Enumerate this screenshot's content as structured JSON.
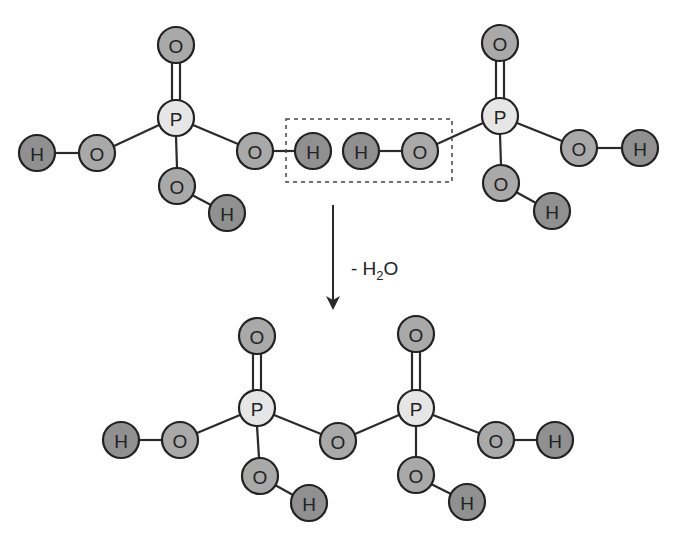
{
  "colors": {
    "phosphorus_fill": "#e6e6e6",
    "oxygen_fill": "#a9a9a9",
    "hydrogen_fill": "#909090",
    "stroke": "#222222"
  },
  "reaction": {
    "label_prefix": "- H",
    "label_sub": "2",
    "label_suffix": "O"
  },
  "atoms": {
    "P": "P",
    "O": "O",
    "H": "H"
  },
  "top_left_molecule": {
    "name": "phosphoric-acid-1",
    "atoms": [
      {
        "id": "tl-P",
        "el": "P",
        "x": 176,
        "y": 118
      },
      {
        "id": "tl-O-top",
        "el": "O",
        "x": 176,
        "y": 45
      },
      {
        "id": "tl-O-left",
        "el": "O",
        "x": 97,
        "y": 153
      },
      {
        "id": "tl-H-left",
        "el": "H",
        "x": 37,
        "y": 153
      },
      {
        "id": "tl-O-right",
        "el": "O",
        "x": 255,
        "y": 151
      },
      {
        "id": "tl-H-right",
        "el": "H",
        "x": 313,
        "y": 151
      },
      {
        "id": "tl-O-bottom",
        "el": "O",
        "x": 177,
        "y": 186
      },
      {
        "id": "tl-H-bottom",
        "el": "H",
        "x": 227,
        "y": 213
      }
    ]
  },
  "top_right_molecule": {
    "name": "phosphoric-acid-2",
    "atoms": [
      {
        "id": "tr-P",
        "el": "P",
        "x": 500,
        "y": 116
      },
      {
        "id": "tr-O-top",
        "el": "O",
        "x": 500,
        "y": 43
      },
      {
        "id": "tr-O-left",
        "el": "O",
        "x": 420,
        "y": 151
      },
      {
        "id": "tr-H-left",
        "el": "H",
        "x": 361,
        "y": 151
      },
      {
        "id": "tr-O-right",
        "el": "O",
        "x": 579,
        "y": 148
      },
      {
        "id": "tr-H-right",
        "el": "H",
        "x": 640,
        "y": 148
      },
      {
        "id": "tr-O-bottom",
        "el": "O",
        "x": 501,
        "y": 183
      },
      {
        "id": "tr-H-bottom",
        "el": "H",
        "x": 552,
        "y": 211
      }
    ]
  },
  "product_molecule": {
    "name": "pyrophosphoric-acid",
    "atoms": [
      {
        "id": "p-P1",
        "el": "P",
        "x": 257,
        "y": 408
      },
      {
        "id": "p-O1-top",
        "el": "O",
        "x": 257,
        "y": 336
      },
      {
        "id": "p-O1-left",
        "el": "O",
        "x": 180,
        "y": 440
      },
      {
        "id": "p-H1-left",
        "el": "H",
        "x": 121,
        "y": 440
      },
      {
        "id": "p-O1-bottom",
        "el": "O",
        "x": 260,
        "y": 476
      },
      {
        "id": "p-H1-bottom",
        "el": "H",
        "x": 309,
        "y": 503
      },
      {
        "id": "p-O-bridge",
        "el": "O",
        "x": 338,
        "y": 441
      },
      {
        "id": "p-P2",
        "el": "P",
        "x": 416,
        "y": 408
      },
      {
        "id": "p-O2-top",
        "el": "O",
        "x": 416,
        "y": 334
      },
      {
        "id": "p-O2-right",
        "el": "O",
        "x": 496,
        "y": 440
      },
      {
        "id": "p-H2-right",
        "el": "H",
        "x": 555,
        "y": 440
      },
      {
        "id": "p-O2-bottom",
        "el": "O",
        "x": 416,
        "y": 475
      },
      {
        "id": "p-H2-bottom",
        "el": "H",
        "x": 467,
        "y": 502
      }
    ]
  }
}
